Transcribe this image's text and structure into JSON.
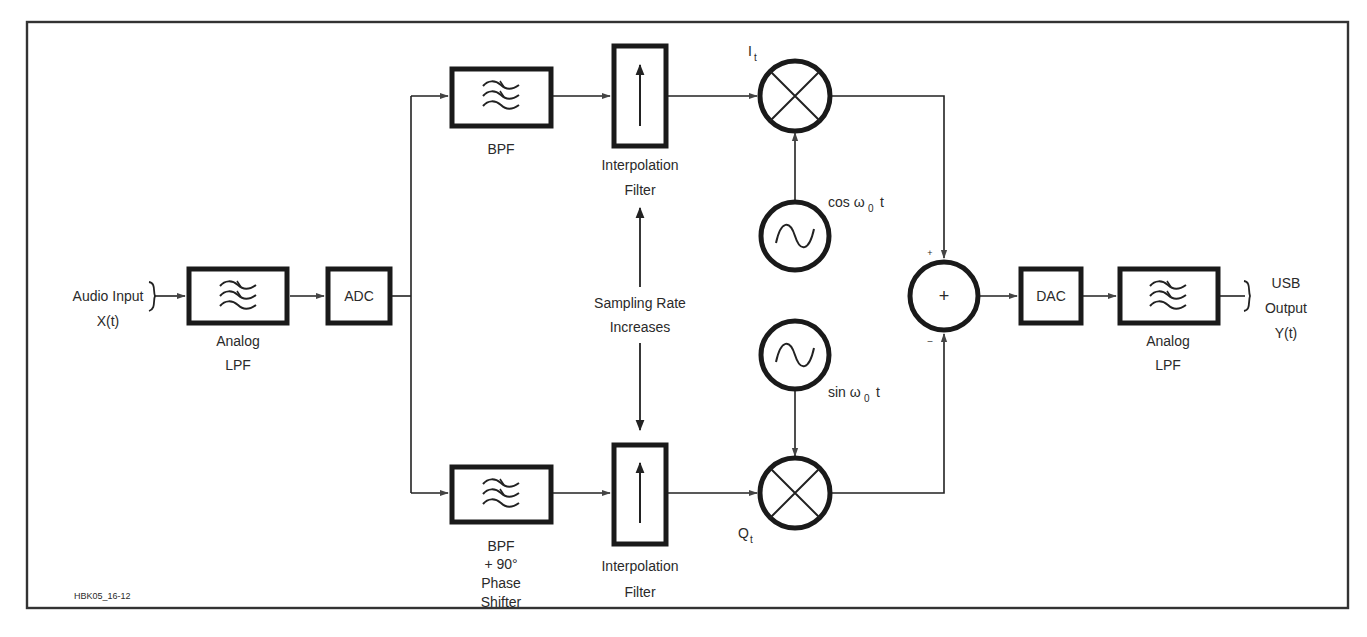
{
  "figure_id": "HBK05_16-12",
  "colors": {
    "line": "#1a1a1a",
    "text": "#2a2a2a",
    "background": "#ffffff"
  },
  "input": {
    "line1": "Audio Input",
    "line2": "X(t)"
  },
  "output": {
    "line1": "USB",
    "line2": "Output",
    "line3": "Y(t)"
  },
  "blocks": {
    "input_lpf": {
      "line1": "Analog",
      "line2": "LPF",
      "icon": "filter-waves-icon"
    },
    "adc": {
      "label": "ADC"
    },
    "bpf_top": {
      "label": "BPF",
      "icon": "filter-waves-icon"
    },
    "bpf_bottom": {
      "line1": "BPF",
      "line2": "+ 90°",
      "line3": "Phase",
      "line4": "Shifter",
      "icon": "filter-waves-icon"
    },
    "interp_top": {
      "line1": "Interpolation",
      "line2": "Filter",
      "icon": "up-arrow-icon"
    },
    "interp_bottom": {
      "line1": "Interpolation",
      "line2": "Filter",
      "icon": "up-arrow-icon"
    },
    "mixer_top": {
      "label_main": "I",
      "label_sub": "t",
      "icon": "multiplier-x-icon"
    },
    "mixer_bottom": {
      "label_main": "Q",
      "label_sub": "t",
      "icon": "multiplier-x-icon"
    },
    "osc_cos": {
      "pre": "cos ω",
      "sub": "0",
      "post": " t",
      "icon": "sine-wave-icon"
    },
    "osc_sin": {
      "pre": "sin ω",
      "sub": "0",
      "post": " t",
      "icon": "sine-wave-icon"
    },
    "summer": {
      "symbol": "+",
      "plus_sign": "+",
      "minus_sign": "–"
    },
    "dac": {
      "label": "DAC"
    },
    "output_lpf": {
      "line1": "Analog",
      "line2": "LPF",
      "icon": "filter-waves-icon"
    }
  },
  "annotation": {
    "line1": "Sampling Rate",
    "line2": "Increases"
  }
}
